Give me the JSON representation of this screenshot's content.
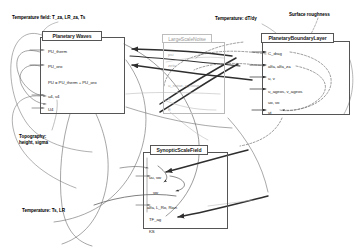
{
  "diagram": {
    "title_hidden": "Climate model component dependency diagram",
    "annotations": [
      {
        "id": "temperature-field",
        "text": "Temperature field: T_za, LR_za, Ts",
        "x": 12,
        "y": 15
      },
      {
        "id": "topography",
        "text": "Topography:",
        "text2": "height, sigma",
        "x": 19,
        "y": 134
      },
      {
        "id": "temperature-ts-lr",
        "text": "Temperature: Ts, LR",
        "x": 22,
        "y": 208
      },
      {
        "id": "temperature-dtdy",
        "text": "Temperature: dT/dy",
        "x": 215,
        "y": 16
      },
      {
        "id": "surface-roughness",
        "text": "Surface roughness",
        "x": 295,
        "y": 12
      }
    ],
    "boxes": [
      {
        "id": "planetary-waves",
        "title": "Planetary Waves",
        "faint": false,
        "x": 40,
        "y": 37,
        "w": 85,
        "h": 77,
        "title_x": 42,
        "title_y": 31,
        "title_w": 60,
        "title_h": 10,
        "fields": [
          {
            "label": "PU_therm",
            "x": 48,
            "y": 49
          },
          {
            "label": "PU_oro",
            "x": 48,
            "y": 64
          },
          {
            "label": "PU = PU_therm + PU_oro",
            "x": 48,
            "y": 80
          },
          {
            "label": "u4, v4",
            "x": 48,
            "y": 94
          },
          {
            "label": "U4",
            "x": 48,
            "y": 107
          }
        ]
      },
      {
        "id": "large-scale-noise",
        "title": "LargeScaleNoise",
        "faint": true,
        "x": 163,
        "y": 42,
        "w": 62,
        "h": 72,
        "title_x": 162,
        "title_y": 34,
        "title_w": 50,
        "title_h": 9,
        "fields": [
          {
            "label": "psi",
            "x": 168,
            "y": 52
          },
          {
            "label": "zeta",
            "x": 168,
            "y": 63
          },
          {
            "label": "u_noise, v_noise",
            "x": 168,
            "y": 83
          },
          {
            "label": "q",
            "x": 168,
            "y": 96
          },
          {
            "label": "E",
            "x": 168,
            "y": 107
          }
        ]
      },
      {
        "id": "planetary-boundary-layer",
        "title": "PlanetaryBoundaryLayer",
        "faint": false,
        "x": 262,
        "y": 41,
        "w": 88,
        "h": 74,
        "title_x": 261,
        "title_y": 33,
        "title_w": 73,
        "title_h": 10,
        "fields": [
          {
            "label": "C_drag",
            "x": 268,
            "y": 51
          },
          {
            "label": "alfa, alfa_za",
            "x": 268,
            "y": 64
          },
          {
            "label": "u, v",
            "x": 268,
            "y": 76
          },
          {
            "label": "u_ageos, v_ageos",
            "x": 268,
            "y": 89
          },
          {
            "label": "uo, vo",
            "x": 268,
            "y": 100
          },
          {
            "label": "ut",
            "x": 268,
            "y": 110
          }
        ]
      },
      {
        "id": "synoptic-scale-field",
        "title": "SynopticScaleField",
        "faint": false,
        "x": 143,
        "y": 152,
        "w": 85,
        "h": 77,
        "title_x": 150,
        "title_y": 145,
        "title_w": 58,
        "title_h": 10,
        "fields": [
          {
            "label": "uu, vw",
            "x": 149,
            "y": 175
          },
          {
            "label": "vw",
            "x": 153,
            "y": 190
          },
          {
            "label": "alfa, L_Ro, Rian",
            "x": 147,
            "y": 205
          },
          {
            "label": "TF_ag",
            "x": 149,
            "y": 217
          },
          {
            "label": "KS",
            "x": 149,
            "y": 229
          }
        ]
      }
    ],
    "colors": {
      "stroke_dark": "#3a3a3a",
      "stroke_mid": "#6f6f6f",
      "stroke_light": "#b5b5b5",
      "border": "#555555",
      "faint_border": "#bdbdbd",
      "background": "#ffffff"
    }
  }
}
